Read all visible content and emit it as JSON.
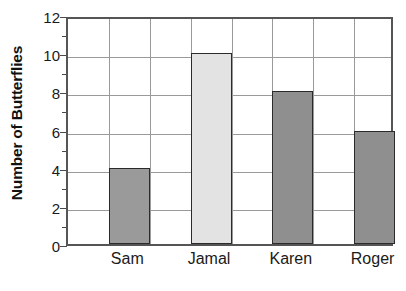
{
  "chart_data": {
    "type": "bar",
    "title": "",
    "subtitle": "",
    "xlabel": "",
    "ylabel": "Number of Butterflies",
    "categories": [
      "Sam",
      "Jamal",
      "Karen",
      "Roger"
    ],
    "values": [
      4,
      10,
      8,
      5.9
    ],
    "series": [
      {
        "name": "Number of Butterflies",
        "values": [
          4,
          10,
          8,
          5.9
        ]
      }
    ],
    "bar_colors": [
      "#9a9a9a",
      "#e3e3e3",
      "#8f8f8f",
      "#8f8f8f"
    ],
    "bar_border_color": "#2b2b2b",
    "ylim": [
      0,
      12
    ],
    "ytick_labels": [
      "0",
      "2",
      "4",
      "6",
      "8",
      "10",
      "12"
    ],
    "ytick_values": [
      0,
      2,
      4,
      6,
      8,
      10,
      12
    ],
    "yminor_tick_values": [
      1,
      3,
      5,
      7,
      9,
      11
    ],
    "grid": "both",
    "gridline_color": "#9a9a9a",
    "axis_color": "#555555",
    "legend": "none",
    "legend_position": "none",
    "background": "#ffffff"
  },
  "axes": {
    "y_title": "Number of Butterflies"
  }
}
